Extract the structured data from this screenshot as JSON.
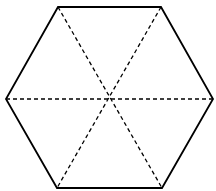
{
  "diagram": {
    "shape": "regular-hexagon",
    "outline_color": "#000000",
    "background": "#ffffff",
    "vertices": [
      [
        58,
        7
      ],
      [
        161,
        7
      ],
      [
        213,
        99
      ],
      [
        162,
        188
      ],
      [
        57,
        188
      ],
      [
        6,
        99
      ]
    ],
    "center": [
      109,
      99
    ],
    "diagonals": "dashed",
    "diagonal_count": 3
  }
}
